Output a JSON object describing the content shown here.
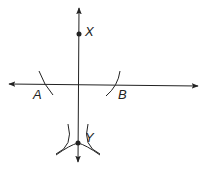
{
  "diagram": {
    "colors": {
      "ink": "#222222",
      "background": "#ffffff"
    },
    "points": [
      {
        "id": "X",
        "label": "X",
        "x": 79,
        "y": 34
      },
      {
        "id": "Y",
        "label": "Y",
        "x": 78,
        "y": 143
      }
    ],
    "labels": [
      {
        "id": "A",
        "text": "A",
        "x": 33,
        "y": 99
      },
      {
        "id": "B",
        "text": "B",
        "x": 118,
        "y": 99
      },
      {
        "id": "X",
        "text": "X",
        "x": 85,
        "y": 36
      },
      {
        "id": "Y",
        "text": "Y",
        "x": 85,
        "y": 142
      }
    ],
    "lines": [
      {
        "id": "vertical-line",
        "from": [
          79,
          8
        ],
        "to": [
          78,
          162
        ],
        "arrows": "both"
      },
      {
        "id": "horizontal-line",
        "from": [
          9,
          84
        ],
        "to": [
          198,
          86
        ],
        "arrows": "both"
      }
    ],
    "arcs": [
      {
        "id": "arc-A",
        "near": "A"
      },
      {
        "id": "arc-B",
        "near": "B"
      },
      {
        "id": "arc-Y-left",
        "near": "Y"
      },
      {
        "id": "arc-Y-right",
        "near": "Y"
      }
    ]
  }
}
